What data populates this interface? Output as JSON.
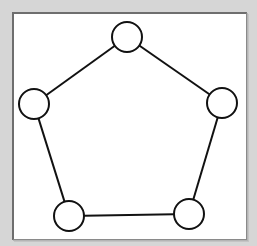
{
  "diagram": {
    "type": "graph",
    "colors": {
      "background": "#d6d6d6",
      "canvas": "#ffffff",
      "stroke": "#111111",
      "node_fill": "#ffffff"
    },
    "node_radius": 15,
    "nodes": [
      {
        "id": "top",
        "x": 127,
        "y": 37
      },
      {
        "id": "right",
        "x": 222,
        "y": 103
      },
      {
        "id": "bottom-right",
        "x": 189,
        "y": 214
      },
      {
        "id": "bottom-left",
        "x": 69,
        "y": 216
      },
      {
        "id": "left",
        "x": 34,
        "y": 104
      }
    ],
    "edges": [
      {
        "from": "top",
        "to": "right"
      },
      {
        "from": "right",
        "to": "bottom-right"
      },
      {
        "from": "bottom-right",
        "to": "bottom-left"
      },
      {
        "from": "bottom-left",
        "to": "left"
      },
      {
        "from": "left",
        "to": "top"
      }
    ]
  }
}
